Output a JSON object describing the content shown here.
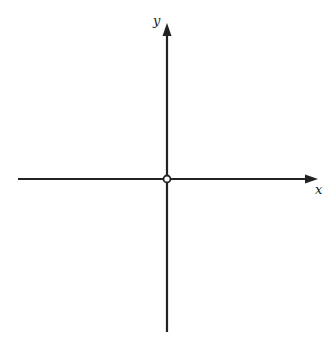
{
  "diagram": {
    "type": "cartesian-axes",
    "x_axis": {
      "label": "x"
    },
    "y_axis": {
      "label": "y"
    },
    "origin": {
      "marker": "open-circle"
    },
    "colors": {
      "axis": "#222222",
      "background": "#ffffff"
    }
  }
}
